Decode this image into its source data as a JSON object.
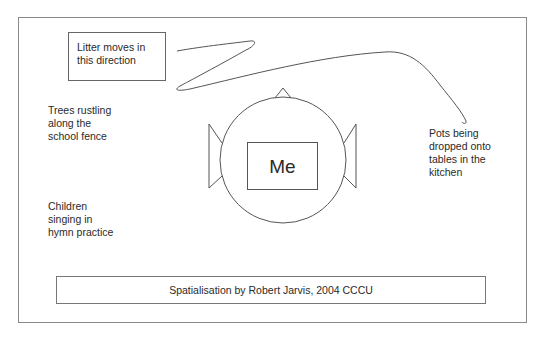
{
  "diagram": {
    "type": "sound-spatialisation-map",
    "center": {
      "label": "Me",
      "head": {
        "cx": 283,
        "cy": 160,
        "r": 63
      }
    },
    "sound_sources": [
      {
        "id": "litter",
        "label": "Litter moves in\nthis direction",
        "boxed": true,
        "position": "top-left"
      },
      {
        "id": "trees",
        "label": "Trees rustling\nalong the\nschool fence",
        "position": "left-upper"
      },
      {
        "id": "children",
        "label": "Children\nsinging in\nhymn practice",
        "position": "left-lower"
      },
      {
        "id": "pots",
        "label": "Pots being\ndropped onto\ntables in the\nkitchen",
        "position": "right"
      }
    ],
    "caption": "Spatialisation by Robert Jarvis, 2004 CCCU",
    "colors": {
      "line": "#555555",
      "frame": "#8a8a8a",
      "text": "#2a2a2a",
      "background": "#ffffff"
    }
  }
}
